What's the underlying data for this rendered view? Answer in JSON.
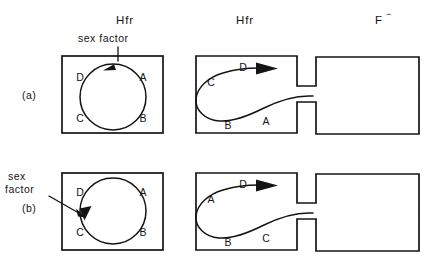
{
  "figure": {
    "background_color": "#ffffff",
    "line_color": "#141414"
  },
  "column_headers": [
    {
      "id": "header-hfr-left",
      "label": "Hfr",
      "x": 125,
      "y": 24
    },
    {
      "id": "header-hfr-middle",
      "label": "Hfr",
      "x": 245,
      "y": 24
    },
    {
      "id": "header-f-minus",
      "label": "F",
      "superscript": "−",
      "x": 385,
      "y": 24
    }
  ],
  "panels": [
    {
      "id": "panel-a",
      "label": "(a)",
      "label_x": 22,
      "label_y": 99,
      "sex_factor": {
        "label_line1": "sex",
        "label_line2": "factor",
        "single_line": "sex  factor",
        "x": 78,
        "y": 42,
        "arrow_from": [
          118,
          47
        ],
        "arrow_to": [
          118,
          62
        ],
        "position_on_circle": "top"
      },
      "donor_circle_cell": {
        "box": {
          "x": 62,
          "y": 56,
          "w": 101,
          "h": 77
        },
        "circle": {
          "cx": 113,
          "cy": 97,
          "r": 33
        },
        "gene_labels": [
          {
            "text": "D",
            "x": 80,
            "y": 81
          },
          {
            "text": "A",
            "x": 142,
            "y": 81
          },
          {
            "text": "C",
            "x": 80,
            "y": 121
          },
          {
            "text": "B",
            "x": 142,
            "y": 121
          }
        ],
        "arrowhead_angle_deg": 270,
        "transfer_direction": "counterclockwise"
      },
      "donor_transfer_cell": {
        "box": {
          "x": 196,
          "y": 56,
          "w": 101,
          "h": 77
        },
        "gene_labels": [
          {
            "text": "D",
            "x": 243,
            "y": 72
          },
          {
            "text": "C",
            "x": 211,
            "y": 85
          },
          {
            "text": "B",
            "x": 227,
            "y": 127
          },
          {
            "text": "A",
            "x": 266,
            "y": 124
          }
        ],
        "leading_gene": "D"
      },
      "recipient_cell": {
        "box": {
          "x": 316,
          "y": 57,
          "w": 103,
          "h": 77
        },
        "contents": "empty"
      },
      "bridge": {
        "x": 297,
        "y": 86,
        "w": 19,
        "h": 16
      }
    },
    {
      "id": "panel-b",
      "label": "(b)",
      "label_x": 22,
      "label_y": 212,
      "sex_factor": {
        "label_line1": "sex",
        "label_line2": "factor",
        "single_line": "sex factor",
        "x": 8,
        "y": 181,
        "arrow_from": [
          52,
          194
        ],
        "arrow_to": [
          86,
          214
        ],
        "position_on_circle": "left"
      },
      "donor_circle_cell": {
        "box": {
          "x": 62,
          "y": 173,
          "w": 101,
          "h": 77
        },
        "circle": {
          "cx": 113,
          "cy": 211,
          "r": 33
        },
        "gene_labels": [
          {
            "text": "D",
            "x": 80,
            "y": 195
          },
          {
            "text": "A",
            "x": 142,
            "y": 195
          },
          {
            "text": "C",
            "x": 80,
            "y": 235
          },
          {
            "text": "B",
            "x": 142,
            "y": 235
          }
        ],
        "arrowhead_angle_deg": 185,
        "transfer_direction": "counterclockwise"
      },
      "donor_transfer_cell": {
        "box": {
          "x": 196,
          "y": 173,
          "w": 101,
          "h": 77
        },
        "gene_labels": [
          {
            "text": "D",
            "x": 243,
            "y": 188
          },
          {
            "text": "A",
            "x": 211,
            "y": 201
          },
          {
            "text": "B",
            "x": 227,
            "y": 242
          },
          {
            "text": "C",
            "x": 266,
            "y": 240
          }
        ],
        "leading_gene": "D"
      },
      "recipient_cell": {
        "box": {
          "x": 316,
          "y": 174,
          "w": 103,
          "h": 77
        },
        "contents": "empty"
      },
      "bridge": {
        "x": 297,
        "y": 203,
        "w": 19,
        "h": 16
      }
    }
  ]
}
